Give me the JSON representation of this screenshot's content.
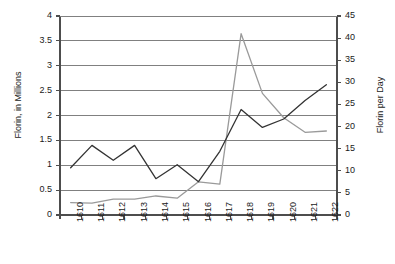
{
  "chart_data": {
    "type": "line",
    "title": "",
    "xlabel": "",
    "grid": true,
    "legend": "none",
    "categories": [
      "1610",
      "1611",
      "1612",
      "1613",
      "1614",
      "1615",
      "1616",
      "1617",
      "1618",
      "1619",
      "1620",
      "1621",
      "1622"
    ],
    "axes": {
      "left": {
        "label": "Florin, in Millions",
        "min": 0,
        "max": 4,
        "step": 0.5,
        "ticks": [
          "0",
          "0.5",
          "1",
          "1.5",
          "2",
          "2.5",
          "3",
          "3.5",
          "4"
        ]
      },
      "right": {
        "label": "Florin per Day",
        "min": 0,
        "max": 45,
        "step": 5,
        "ticks": [
          "0",
          "5",
          "10",
          "15",
          "20",
          "25",
          "30",
          "35",
          "40",
          "45"
        ]
      }
    },
    "series": [
      {
        "name": "Florin, in Millions",
        "axis": "left",
        "color": "#333333",
        "values": [
          0.95,
          1.4,
          1.1,
          1.4,
          0.73,
          1.01,
          0.67,
          1.28,
          2.12,
          1.76,
          1.93,
          2.3,
          2.62
        ]
      },
      {
        "name": "Florin per Day",
        "axis": "right",
        "color": "#9a9a9a",
        "values": [
          2.8,
          2.7,
          3.6,
          3.6,
          4.3,
          3.8,
          7.5,
          7.0,
          41.0,
          27.5,
          22.0,
          18.7,
          19.0
        ]
      }
    ]
  },
  "colors": {
    "gridline": "#808080",
    "axis": "#4d4d4d",
    "series_dark": "#333333",
    "series_light": "#9a9a9a",
    "background": "#ffffff"
  }
}
